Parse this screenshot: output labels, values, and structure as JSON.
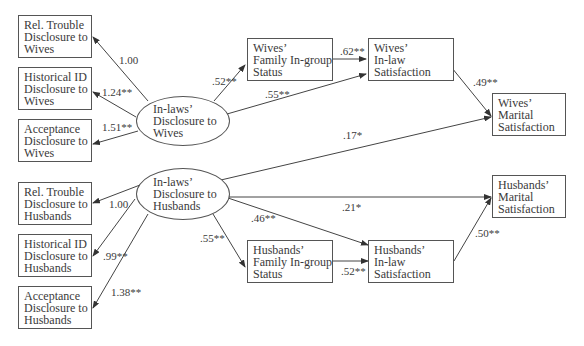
{
  "diagram": {
    "type": "path-model",
    "latent_nodes": [
      {
        "id": "inlaws_wives",
        "lines": [
          "In-laws’",
          "Disclosure to",
          "Wives"
        ]
      },
      {
        "id": "inlaws_husbands",
        "lines": [
          "In-laws’",
          "Disclosure to",
          "Husbands"
        ]
      }
    ],
    "observed_nodes": [
      {
        "id": "rel_trouble_wives",
        "lines": [
          "Rel. Trouble",
          "Disclosure to",
          "Wives"
        ]
      },
      {
        "id": "historical_id_wives",
        "lines": [
          "Historical ID",
          "Disclosure to",
          "Wives"
        ]
      },
      {
        "id": "acceptance_wives",
        "lines": [
          "Acceptance",
          "Disclosure to",
          "Wives"
        ]
      },
      {
        "id": "rel_trouble_husbands",
        "lines": [
          "Rel. Trouble",
          "Disclosure to",
          "Husbands"
        ]
      },
      {
        "id": "historical_id_husbands",
        "lines": [
          "Historical ID",
          "Disclosure to",
          "Husbands"
        ]
      },
      {
        "id": "acceptance_husbands",
        "lines": [
          "Acceptance",
          "Disclosure to",
          "Husbands"
        ]
      },
      {
        "id": "wives_ingroup",
        "lines": [
          "Wives’",
          "Family In-group",
          "Status"
        ]
      },
      {
        "id": "wives_inlaw_sat",
        "lines": [
          "Wives’",
          "In-law",
          "Satisfaction"
        ]
      },
      {
        "id": "wives_marital_sat",
        "lines": [
          "Wives’",
          "Marital",
          "Satisfaction"
        ]
      },
      {
        "id": "husbands_ingroup",
        "lines": [
          "Husbands’",
          "Family In-group",
          "Status"
        ]
      },
      {
        "id": "husbands_inlaw_sat",
        "lines": [
          "Husbands’",
          "In-law",
          "Satisfaction"
        ]
      },
      {
        "id": "husbands_marital_sat",
        "lines": [
          "Husbands’",
          "Marital",
          "Satisfaction"
        ]
      }
    ],
    "edges": [
      {
        "from": "inlaws_wives",
        "to": "rel_trouble_wives",
        "label": "1.00"
      },
      {
        "from": "inlaws_wives",
        "to": "historical_id_wives",
        "label": "1.24**"
      },
      {
        "from": "inlaws_wives",
        "to": "acceptance_wives",
        "label": "1.51**"
      },
      {
        "from": "inlaws_wives",
        "to": "wives_ingroup",
        "label": ".52**"
      },
      {
        "from": "inlaws_wives",
        "to": "wives_inlaw_sat",
        "label": ".55**"
      },
      {
        "from": "wives_ingroup",
        "to": "wives_inlaw_sat",
        "label": ".62**"
      },
      {
        "from": "wives_inlaw_sat",
        "to": "wives_marital_sat",
        "label": ".49**"
      },
      {
        "from": "inlaws_husbands",
        "to": "wives_marital_sat",
        "label": ".17*"
      },
      {
        "from": "inlaws_husbands",
        "to": "rel_trouble_husbands",
        "label": "1.00"
      },
      {
        "from": "inlaws_husbands",
        "to": "historical_id_husbands",
        "label": ".99**"
      },
      {
        "from": "inlaws_husbands",
        "to": "acceptance_husbands",
        "label": "1.38**"
      },
      {
        "from": "inlaws_husbands",
        "to": "husbands_ingroup",
        "label": ".55**"
      },
      {
        "from": "inlaws_husbands",
        "to": "husbands_inlaw_sat",
        "label": ".46**"
      },
      {
        "from": "inlaws_husbands",
        "to": "husbands_marital_sat",
        "label": ".21*"
      },
      {
        "from": "husbands_ingroup",
        "to": "husbands_inlaw_sat",
        "label": ".52**"
      },
      {
        "from": "husbands_inlaw_sat",
        "to": "husbands_marital_sat",
        "label": ".50**"
      }
    ]
  }
}
